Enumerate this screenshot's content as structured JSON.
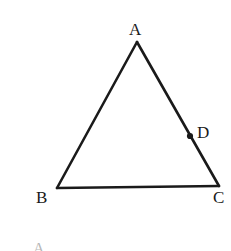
{
  "figure": {
    "background_color": "#ffffff",
    "stroke_color": "#1a1a1a",
    "stroke_width": 2.6,
    "canvas": {
      "width": 231,
      "height": 251
    },
    "labels": {
      "a": "A",
      "b": "B",
      "c": "C",
      "d": "D"
    },
    "bottom_fragment_text": "A"
  },
  "chart_data": {
    "type": "diagram",
    "shape": "triangle",
    "points": [
      {
        "name": "A",
        "x": 137,
        "y": 42,
        "label": "A",
        "label_x": 129,
        "label_y": 21,
        "marker": "none"
      },
      {
        "name": "B",
        "x": 57,
        "y": 188,
        "label": "B",
        "label_x": 36,
        "label_y": 189,
        "marker": "none"
      },
      {
        "name": "C",
        "x": 219,
        "y": 186,
        "label": "C",
        "label_x": 213,
        "label_y": 189,
        "marker": "none"
      },
      {
        "name": "D",
        "x": 190,
        "y": 136,
        "label": "D",
        "label_x": 197,
        "label_y": 124,
        "marker": "filled-dot"
      }
    ],
    "segments": [
      {
        "name": "AB",
        "from": "A",
        "to": "B"
      },
      {
        "name": "BC",
        "from": "B",
        "to": "C"
      },
      {
        "name": "CA",
        "from": "C",
        "to": "A"
      }
    ],
    "markers": [
      {
        "on_segment": "CA",
        "point": "D",
        "style": "filled",
        "radius": 3.1
      }
    ],
    "grid": false,
    "legend": null,
    "xlabel": "",
    "ylabel": ""
  }
}
